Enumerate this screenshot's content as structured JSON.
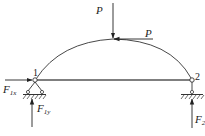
{
  "diagram": {
    "type": "arch structure with supports and loads",
    "nodes": [
      {
        "id": "1",
        "label": "1",
        "x": 35,
        "y": 80,
        "support": "pin (fixed hinge)"
      },
      {
        "id": "2",
        "label": "2",
        "x": 192,
        "y": 80,
        "support": "roller"
      }
    ],
    "members": [
      {
        "from": "1",
        "to": "2",
        "shape": "arch",
        "apex": [
          113,
          39
        ]
      },
      {
        "from": "1",
        "to": "2",
        "shape": "straight tie"
      }
    ],
    "loads": [
      {
        "label": "P",
        "direction": "down",
        "at": "arch apex"
      },
      {
        "label": "P",
        "direction": "left (horizontal)",
        "at": "arch apex"
      }
    ],
    "reactions": [
      {
        "label_main": "F",
        "label_sub": "1x",
        "direction": "right",
        "at": "1"
      },
      {
        "label_main": "F",
        "label_sub": "1y",
        "direction": "up",
        "at": "1"
      },
      {
        "label_main": "F",
        "label_sub": "2",
        "direction": "up",
        "at": "2"
      }
    ]
  },
  "labels": {
    "p_vertical": "P",
    "p_horizontal": "P",
    "node1": "1",
    "node2": "2",
    "f1x_main": "F",
    "f1x_sub": "1x",
    "f1y_main": "F",
    "f1y_sub": "1y",
    "f2_main": "F",
    "f2_sub": "2"
  },
  "colors": {
    "line": "#333333",
    "background": "#ffffff"
  }
}
